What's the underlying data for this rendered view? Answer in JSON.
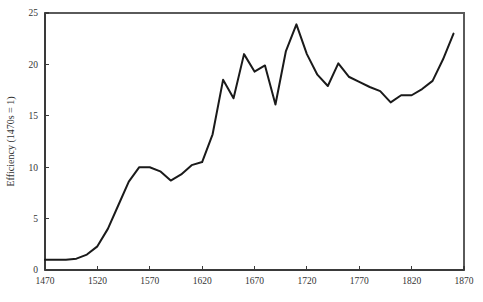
{
  "chart_data": {
    "type": "line",
    "title": "",
    "subtitle": "",
    "xlabel": "",
    "ylabel": "Efficiency (1470s = 1)",
    "xlim": [
      1470,
      1870
    ],
    "ylim": [
      0,
      25
    ],
    "grid": false,
    "legend": false,
    "legend_position": "none",
    "xticks": [
      1470,
      1520,
      1570,
      1620,
      1670,
      1720,
      1770,
      1820,
      1870
    ],
    "xticklabels": [
      "1470",
      "1520",
      "1570",
      "1620",
      "1670",
      "1720",
      "1770",
      "1820",
      "1870"
    ],
    "yticks": [
      0,
      5,
      10,
      15,
      20,
      25
    ],
    "yticklabels": [
      "0",
      "5",
      "10",
      "15",
      "20",
      "25"
    ],
    "line_color": "#1a1a1a",
    "axis_color": "#3a3a3a",
    "background_color": "#ffffff",
    "series": [
      {
        "name": "Efficiency",
        "x": [
          1470,
          1480,
          1490,
          1500,
          1510,
          1520,
          1530,
          1540,
          1550,
          1560,
          1570,
          1580,
          1590,
          1600,
          1610,
          1620,
          1630,
          1640,
          1650,
          1660,
          1670,
          1680,
          1690,
          1700,
          1710,
          1720,
          1730,
          1740,
          1750,
          1760,
          1770,
          1780,
          1790,
          1800,
          1810,
          1820,
          1830,
          1840,
          1850,
          1860
        ],
        "values": [
          1.0,
          1.0,
          1.0,
          1.1,
          1.5,
          2.3,
          4.0,
          6.3,
          8.6,
          10.0,
          10.0,
          9.6,
          8.7,
          9.3,
          10.2,
          10.5,
          13.2,
          18.5,
          16.7,
          21.0,
          19.3,
          19.9,
          16.1,
          21.3,
          23.9,
          21.0,
          19.0,
          17.9,
          20.1,
          18.8,
          18.3,
          17.8,
          17.4,
          16.3,
          17.0,
          17.0,
          17.6,
          18.4,
          20.5,
          23.0
        ]
      }
    ]
  },
  "figure": {
    "plot_area": {
      "left": 45,
      "right": 464,
      "top": 13,
      "bottom": 270
    }
  }
}
